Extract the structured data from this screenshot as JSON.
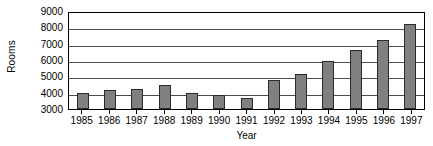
{
  "chart_data": {
    "type": "bar",
    "title": "",
    "xlabel": "Year",
    "ylabel": "Rooms",
    "categories": [
      "1985",
      "1986",
      "1987",
      "1988",
      "1989",
      "1990",
      "1991",
      "1992",
      "1993",
      "1994",
      "1995",
      "1996",
      "1997"
    ],
    "values": [
      3950,
      4150,
      4250,
      4450,
      4000,
      3850,
      3700,
      4800,
      5150,
      5950,
      6600,
      7200,
      8200
    ],
    "ylim": [
      3000,
      9000
    ],
    "yticks": [
      3000,
      4000,
      5000,
      6000,
      7000,
      8000,
      9000
    ],
    "ytick_labels": [
      "3000",
      "4000",
      "5000",
      "6000",
      "7000",
      "8000",
      "9000"
    ],
    "grid": true,
    "legend": false,
    "series": [
      {
        "name": "Rooms",
        "color": "#808080",
        "values": [
          3950,
          4150,
          4250,
          4450,
          4000,
          3850,
          3700,
          4800,
          5150,
          5950,
          6600,
          7200,
          8200
        ]
      }
    ],
    "colors": {
      "bar_fill": "#808080",
      "bar_border": "#2b2b2b",
      "gridline": "#4d4d4d",
      "axis": "#000000",
      "background": "#ffffff",
      "text": "#000000"
    }
  }
}
